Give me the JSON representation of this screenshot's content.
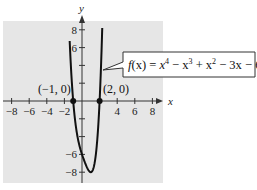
{
  "chart_data": {
    "type": "line",
    "title": "",
    "function_label": "f(x) = x⁴ − x³ + x² − 3x − 6",
    "function_parts": {
      "f": "f",
      "arg": "(x)",
      "eq": " = ",
      "t1": "x",
      "e1": "4",
      "t2": " − x",
      "e2": "3",
      "t3": " + x",
      "e3": "2",
      "t4": " − 3x − 6"
    },
    "xlabel": "x",
    "ylabel": "y",
    "xlim": [
      -9,
      9
    ],
    "ylim": [
      -9,
      9
    ],
    "grid": false,
    "background": "#e6e6e6",
    "line_color": "#111111",
    "x_ticks": [
      -8,
      -6,
      -4,
      -2,
      2,
      4,
      6,
      8
    ],
    "x_tick_labels": [
      "−8",
      "−6",
      "−4",
      "−2",
      "",
      "4",
      "6",
      "8"
    ],
    "y_ticks": [
      -8,
      -6,
      -4,
      -2,
      2,
      4,
      6,
      8
    ],
    "y_tick_labels": [
      "−8",
      "−6",
      "",
      "",
      "",
      "",
      "6",
      "8"
    ],
    "series": [
      {
        "name": "f(x) = x^4 - x^3 + x^2 - 3x - 6",
        "x": [
          -1.4,
          -1.3,
          -1.2,
          -1.1,
          -1.0,
          -0.8,
          -0.6,
          -0.4,
          -0.2,
          0.0,
          0.2,
          0.4,
          0.6,
          0.8,
          1.0,
          1.2,
          1.4,
          1.6,
          1.8,
          2.0,
          2.1,
          2.2,
          2.3
        ],
        "y": [
          7.86,
          5.38,
          3.33,
          1.53,
          0.0,
          -2.49,
          -4.39,
          -5.79,
          -6.73,
          -6.0,
          -6.57,
          -7.09,
          -7.51,
          -7.78,
          -8.0,
          -7.87,
          -7.51,
          -6.29,
          -4.27,
          0.0,
          2.57,
          5.51,
          9.1
        ]
      }
    ],
    "annotations": [
      {
        "label": "(−1, 0)",
        "x": -1,
        "y": 0
      },
      {
        "label": "(2, 0)",
        "x": 2,
        "y": 0
      }
    ]
  }
}
